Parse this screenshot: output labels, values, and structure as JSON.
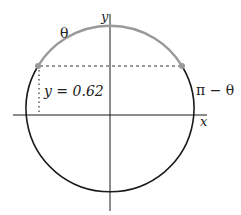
{
  "diagram": {
    "type": "unit-circle",
    "labels": {
      "y_axis": "y",
      "x_axis": "x",
      "theta": "θ",
      "pi_minus_theta": "π − θ",
      "y_value": "y = 0.62"
    },
    "values": {
      "y": 0.62
    },
    "colors": {
      "circle": "#1a1a1a",
      "arc": "#999999",
      "axes": "#1a1a1a",
      "guides": "#333333",
      "points": "#999999"
    }
  }
}
